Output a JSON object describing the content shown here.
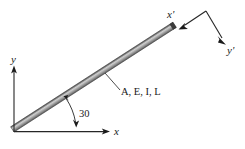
{
  "figure": {
    "background_color": "#ffffff"
  },
  "labels": {
    "global_x": "x",
    "global_y": "y",
    "local_x": "x'",
    "local_y": "y'",
    "angle": "30",
    "properties": "A, E, I, L"
  },
  "colors": {
    "beam_light": "#c9c9c9",
    "beam_mid": "#a8a8a8",
    "beam_dark": "#6e6e6e",
    "beam_edge": "#4a4a4a",
    "beam_cap": "#3c3c3c",
    "line": "#262626",
    "text": "#1a1a1a"
  },
  "geometry": {
    "beam": {
      "start_x": 14,
      "start_y": 132,
      "end_x": 177,
      "end_y": 27,
      "thickness": 6,
      "angle_degrees": 30
    },
    "global_axes": {
      "origin_x": 14,
      "origin_y": 132,
      "x_axis_end": 110,
      "y_axis_end": 66
    },
    "local_axes": {
      "vertex_x": 206,
      "vertex_y": 11,
      "x_tip_x": 178,
      "x_tip_y": 30,
      "y_tip_x": 225,
      "y_tip_y": 43
    },
    "angle_arc": {
      "center_x": 14,
      "center_y": 132,
      "radius": 62,
      "label_x": 78,
      "label_y": 117
    },
    "leader": {
      "from_x": 106,
      "from_y": 74,
      "to_x": 120,
      "to_y": 90
    }
  }
}
